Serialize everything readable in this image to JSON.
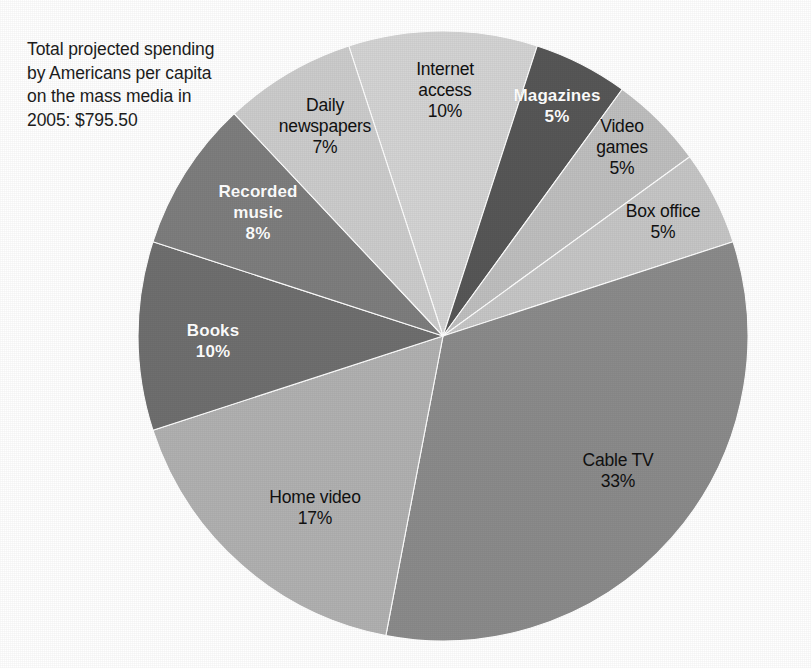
{
  "caption": {
    "text": "Total projected spending\nby Americans per capita\non the mass media in\n2005: $795.50"
  },
  "chart_data": {
    "type": "pie",
    "title": "Total projected spending by Americans per capita on the mass media in 2005: $795.50",
    "total_label": "$795.50",
    "total_value": 795.5,
    "unit": "percent",
    "legend": "none",
    "grid": false,
    "start_angle_deg": -18,
    "direction": "clockwise",
    "categories": [
      "Internet access",
      "Magazines",
      "Video games",
      "Box office",
      "Cable TV",
      "Home video",
      "Books",
      "Recorded music",
      "Daily newspapers"
    ],
    "values": [
      10,
      5,
      5,
      5,
      33,
      17,
      10,
      8,
      7
    ],
    "colors": [
      "#d4d4d4",
      "#575757",
      "#bfbfbf",
      "#c6c6c6",
      "#8b8b8b",
      "#b1b1b1",
      "#6f6f6f",
      "#7e7e7e",
      "#cccccc"
    ],
    "slices": [
      {
        "name": "Internet access",
        "label": "Internet\naccess\n10%",
        "value": 10,
        "color": "#d4d4d4",
        "text_style": "dark",
        "label_x": 445,
        "label_y": 90
      },
      {
        "name": "Magazines",
        "label": "Magazines\n5%",
        "value": 5,
        "color": "#575757",
        "text_style": "light",
        "label_x": 557,
        "label_y": 106
      },
      {
        "name": "Video games",
        "label": "Video\ngames\n5%",
        "value": 5,
        "color": "#bfbfbf",
        "text_style": "dark",
        "label_x": 622,
        "label_y": 147
      },
      {
        "name": "Box office",
        "label": "Box office\n5%",
        "value": 5,
        "color": "#c6c6c6",
        "text_style": "dark",
        "label_x": 663,
        "label_y": 222
      },
      {
        "name": "Cable TV",
        "label": "Cable TV\n33%",
        "value": 33,
        "color": "#8b8b8b",
        "text_style": "dark",
        "label_x": 618,
        "label_y": 471
      },
      {
        "name": "Home video",
        "label": "Home video\n17%",
        "value": 17,
        "color": "#b1b1b1",
        "text_style": "dark",
        "label_x": 315,
        "label_y": 508
      },
      {
        "name": "Books",
        "label": "Books\n10%",
        "value": 10,
        "color": "#6f6f6f",
        "text_style": "light",
        "label_x": 213,
        "label_y": 341
      },
      {
        "name": "Recorded music",
        "label": "Recorded\nmusic\n8%",
        "value": 8,
        "color": "#7e7e7e",
        "text_style": "light",
        "label_x": 258,
        "label_y": 212
      },
      {
        "name": "Daily newspapers",
        "label": "Daily\nnewspapers\n7%",
        "value": 7,
        "color": "#cccccc",
        "text_style": "dark",
        "label_x": 325,
        "label_y": 126
      }
    ],
    "geometry": {
      "cx": 443,
      "cy": 336,
      "r": 305
    }
  }
}
